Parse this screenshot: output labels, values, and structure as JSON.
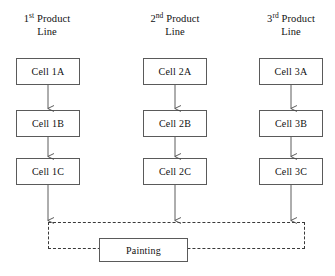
{
  "diagram": {
    "title_text": "Product line cellular layout with shared painting station",
    "stroke_color": "#5a5a5a",
    "dashed_color": "#3a3a3a",
    "background_color": "#ffffff",
    "text_color": "#111111",
    "columns": [
      {
        "header_number": "1",
        "header_ordinal": "st",
        "header_word": "Product",
        "header_line2": "Line",
        "cells": [
          {
            "label": "Cell 1A"
          },
          {
            "label": "Cell 1B"
          },
          {
            "label": "Cell 1C"
          }
        ]
      },
      {
        "header_number": "2",
        "header_ordinal": "nd",
        "header_word": "Product",
        "header_line2": "Line",
        "cells": [
          {
            "label": "Cell 2A"
          },
          {
            "label": "Cell 2B"
          },
          {
            "label": "Cell 2C"
          }
        ]
      },
      {
        "header_number": "3",
        "header_ordinal": "rd",
        "header_word": "Product",
        "header_line2": "Line",
        "cells": [
          {
            "label": "Cell 3A"
          },
          {
            "label": "Cell 3B"
          },
          {
            "label": "Cell 3C"
          }
        ]
      }
    ],
    "shared_station": {
      "label": "Painting"
    }
  }
}
